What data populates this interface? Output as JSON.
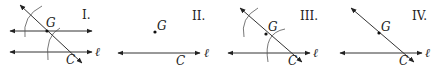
{
  "panels": [
    {
      "id": "I",
      "numeral": "I.",
      "point_label": "G",
      "intersection_label": "C",
      "line_label": "ℓ"
    },
    {
      "id": "II",
      "numeral": "II.",
      "point_label": "G",
      "intersection_label": "C",
      "line_label": "ℓ"
    },
    {
      "id": "III",
      "numeral": "III.",
      "point_label": "G",
      "intersection_label": "C",
      "line_label": "ℓ"
    },
    {
      "id": "IV",
      "numeral": "IV.",
      "point_label": "G",
      "intersection_label": "C",
      "line_label": "ℓ"
    }
  ]
}
